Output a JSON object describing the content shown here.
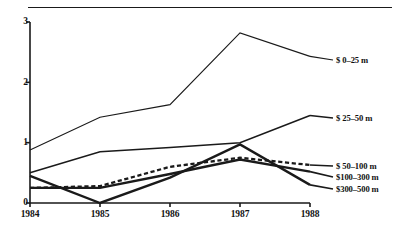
{
  "chart_data": {
    "type": "line",
    "title": "",
    "xlabel": "",
    "ylabel": "",
    "x": [
      "1984",
      "1985",
      "1986",
      "1987",
      "1988"
    ],
    "xticklabels": [
      "1984",
      "1985",
      "1986",
      "1987",
      "1988"
    ],
    "yticklabels": [
      "0",
      "1",
      "2",
      "3"
    ],
    "ylim": [
      0,
      3
    ],
    "yticks": [
      0,
      1,
      2,
      3
    ],
    "grid": false,
    "legend_position": "right-inline",
    "series": [
      {
        "name": "$ 0–25 m",
        "values": [
          0.88,
          1.42,
          1.63,
          2.82,
          2.43
        ],
        "style": "solid",
        "width": 1.1,
        "label_y": 60
      },
      {
        "name": "$ 25–50 m",
        "values": [
          0.5,
          0.85,
          0.92,
          1.0,
          1.45
        ],
        "style": "solid",
        "width": 1.5,
        "label_y": 118
      },
      {
        "name": "$ 50–100 m",
        "values": [
          0.25,
          0.28,
          0.6,
          0.75,
          0.63
        ],
        "style": "dashed",
        "width": 2.3,
        "label_y": 166
      },
      {
        "name": "$100–300 m",
        "values": [
          0.25,
          0.25,
          0.48,
          0.72,
          0.52
        ],
        "style": "solid",
        "width": 2.4,
        "label_y": 177
      },
      {
        "name": "$300–500 m",
        "values": [
          0.45,
          0.0,
          0.42,
          0.97,
          0.3
        ],
        "style": "solid",
        "width": 2.4,
        "label_y": 189
      }
    ]
  },
  "axis": {
    "y": {
      "ticks": [
        "3",
        "2",
        "1",
        "0"
      ]
    },
    "x": {
      "ticks": [
        "1984",
        "1985",
        "1986",
        "1987",
        "1988"
      ]
    }
  }
}
